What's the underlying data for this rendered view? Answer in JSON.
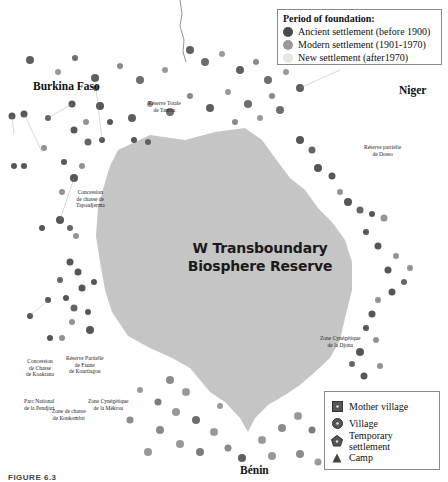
{
  "figure": {
    "caption": "FIGURE 6.3",
    "reserve_label_line1": "W Transboundary",
    "reserve_label_line2": "Biosphere Reserve",
    "colors": {
      "reserve_fill": "#c8c8c8",
      "ancient": "#4a4a4a",
      "modern": "#9a9a9a",
      "new": "#e6e6e6",
      "background": "#ffffff"
    }
  },
  "countries": [
    {
      "name": "Burkina Faso"
    },
    {
      "name": "Niger"
    },
    {
      "name": "Bénin"
    }
  ],
  "zones": [
    {
      "name": "Réserve Totale\nde Tamou"
    },
    {
      "name": "Réserve partielle\nde Dosso"
    },
    {
      "name": "Concession\nde chasse de\nTapoadjerma"
    },
    {
      "name": "Zone Cynégétique\nde la Djona"
    },
    {
      "name": "Concession\nde Chasse\nde Koakrana"
    },
    {
      "name": "Réserve Partielle\nde Faune\nde Kourtiagou"
    },
    {
      "name": "Parc National\nde la Pendjari"
    },
    {
      "name": "Zone de chasse\nde Konkombri"
    },
    {
      "name": "Zone Cynégétique\nde la Mékrou"
    }
  ],
  "legend_period": {
    "title": "Period of foundation:",
    "items": [
      {
        "label": "Ancient settlement (before 1900)",
        "color": "#4a4a4a"
      },
      {
        "label": "Modern settlement (1901-1970)",
        "color": "#9a9a9a"
      },
      {
        "label": "New settlement (after1970)",
        "color": "#e6e6e6"
      }
    ]
  },
  "legend_type": {
    "items": [
      {
        "label": "Mother village",
        "symbol": "square-dot-icon"
      },
      {
        "label": "Village",
        "symbol": "circle-dot-icon"
      },
      {
        "label": "Temporary settlement",
        "symbol": "pentagon-icon"
      },
      {
        "label": "Camp",
        "symbol": "triangle-icon"
      }
    ]
  }
}
